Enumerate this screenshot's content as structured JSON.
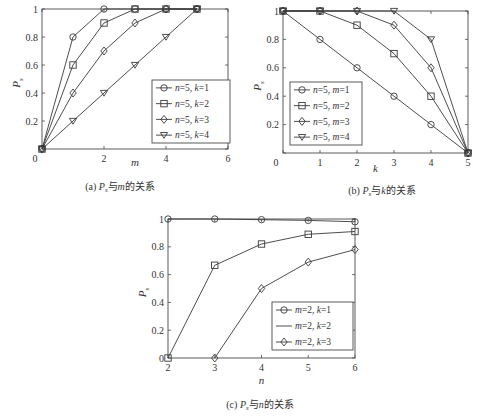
{
  "chart_data": [
    {
      "id": "a",
      "type": "line",
      "caption": "(a) Ps与m的关系",
      "caption_parts": {
        "prefix": "(a) ",
        "var": "P",
        "sub": "s",
        "mid": "与",
        "xvar": "m",
        "suffix": "的关系"
      },
      "xlabel": "m",
      "ylabel": "Ps",
      "xlim": [
        0,
        6
      ],
      "ylim": [
        0,
        1
      ],
      "xticks": [
        0,
        2,
        4,
        6
      ],
      "yticks": [
        0,
        0.2,
        0.4,
        0.6,
        0.8,
        1
      ],
      "ytick_labels": [
        "0",
        "0.2",
        "0.4",
        "0.6",
        "0.8",
        "1"
      ],
      "xtick_labels": [
        "0",
        "2",
        "4",
        "6"
      ],
      "grid": false,
      "legend_position": "lower right",
      "series": [
        {
          "name": "n=5, k=1",
          "marker": "circle",
          "x": [
            0,
            1,
            2,
            3,
            4,
            5
          ],
          "values": [
            0,
            0.8,
            1,
            1,
            1,
            1
          ]
        },
        {
          "name": "n=5, k=2",
          "marker": "square",
          "x": [
            0,
            1,
            2,
            3,
            4,
            5
          ],
          "values": [
            0,
            0.6,
            0.9,
            1,
            1,
            1
          ]
        },
        {
          "name": "n=5, k=3",
          "marker": "diamond",
          "x": [
            0,
            1,
            2,
            3,
            4,
            5
          ],
          "values": [
            0,
            0.4,
            0.7,
            0.9,
            1,
            1
          ]
        },
        {
          "name": "n=5, k=4",
          "marker": "triangle-down",
          "x": [
            0,
            1,
            2,
            3,
            4,
            5
          ],
          "values": [
            0,
            0.2,
            0.4,
            0.6,
            0.8,
            1
          ]
        }
      ]
    },
    {
      "id": "b",
      "type": "line",
      "caption": "(b) Ps与k的关系",
      "caption_parts": {
        "prefix": "(b) ",
        "var": "P",
        "sub": "s",
        "mid": "与",
        "xvar": "k",
        "suffix": "的关系"
      },
      "xlabel": "k",
      "ylabel": "Ps",
      "xlim": [
        0,
        5
      ],
      "ylim": [
        0,
        1
      ],
      "xticks": [
        0,
        1,
        2,
        3,
        4,
        5
      ],
      "xtick_labels": [
        "0",
        "1",
        "2",
        "3",
        "4",
        "5"
      ],
      "yticks": [
        0,
        0.2,
        0.4,
        0.6,
        0.8,
        1
      ],
      "ytick_labels": [
        "",
        "0.2",
        "0.4",
        "0.6",
        "0.8",
        "1"
      ],
      "grid": false,
      "legend_position": "lower left",
      "series": [
        {
          "name": "n=5, m=1",
          "marker": "circle",
          "x": [
            0,
            1,
            2,
            3,
            4,
            5
          ],
          "values": [
            1,
            0.8,
            0.6,
            0.4,
            0.2,
            0
          ]
        },
        {
          "name": "n=5, m=2",
          "marker": "square",
          "x": [
            0,
            1,
            2,
            3,
            4,
            5
          ],
          "values": [
            1,
            1,
            0.9,
            0.7,
            0.4,
            0
          ]
        },
        {
          "name": "n=5, m=3",
          "marker": "diamond",
          "x": [
            0,
            1,
            2,
            3,
            4,
            5
          ],
          "values": [
            1,
            1,
            1,
            0.9,
            0.6,
            0
          ]
        },
        {
          "name": "n=5, m=4",
          "marker": "triangle-down",
          "x": [
            0,
            1,
            2,
            3,
            4,
            5
          ],
          "values": [
            1,
            1,
            1,
            1,
            0.8,
            0
          ]
        }
      ]
    },
    {
      "id": "c",
      "type": "line",
      "caption": "(c) Ps与n的关系",
      "caption_parts": {
        "prefix": "(c) ",
        "var": "P",
        "sub": "s",
        "mid": "与",
        "xvar": "n",
        "suffix": "的关系"
      },
      "xlabel": "n",
      "ylabel": "Ps",
      "xlim": [
        2,
        6
      ],
      "ylim": [
        0,
        1
      ],
      "xticks": [
        2,
        3,
        4,
        5,
        6
      ],
      "xtick_labels": [
        "2",
        "3",
        "4",
        "5",
        "6"
      ],
      "yticks": [
        0,
        0.2,
        0.4,
        0.6,
        0.8,
        1
      ],
      "ytick_labels": [
        "0",
        "0.2",
        "0.4",
        "0.6",
        "0.8",
        "1"
      ],
      "grid": false,
      "legend_position": "lower right",
      "series": [
        {
          "name": "m=2, k=1",
          "marker": "circle",
          "legend_marker": "circle",
          "x": [
            2,
            3,
            4,
            5,
            6
          ],
          "values": [
            1,
            1,
            0.995,
            0.99,
            0.98
          ]
        },
        {
          "name": "m=2, k=2",
          "marker": "square",
          "legend_marker": "none",
          "x": [
            2,
            3,
            4,
            5,
            6
          ],
          "values": [
            0,
            0.667,
            0.82,
            0.89,
            0.91
          ]
        },
        {
          "name": "m=2, k=3",
          "marker": "diamond",
          "legend_marker": "diamond",
          "x": [
            3,
            4,
            5,
            6
          ],
          "values": [
            0,
            0.5,
            0.69,
            0.78
          ]
        }
      ]
    }
  ],
  "layout": {
    "plots": [
      {
        "left": 42,
        "right": 228,
        "top": 9,
        "bottom": 149,
        "legend": {
          "x": 152,
          "y": 80,
          "w": 78,
          "h": 63
        },
        "xlabel_y": 166,
        "caption_y": 190,
        "caption_cx": 120
      },
      {
        "left": 283,
        "right": 468,
        "top": 11,
        "bottom": 153,
        "legend": {
          "x": 290,
          "y": 82,
          "w": 72,
          "h": 63
        },
        "xlabel_y": 172,
        "caption_y": 194,
        "caption_cx": 382
      },
      {
        "left": 168,
        "right": 355,
        "top": 219,
        "bottom": 358,
        "legend": {
          "x": 272,
          "y": 302,
          "w": 81,
          "h": 48
        },
        "xlabel_y": 384,
        "caption_y": 408,
        "caption_cx": 260
      }
    ],
    "line_color": "#3a3a3a",
    "axis_color": "#4a4a4a"
  }
}
